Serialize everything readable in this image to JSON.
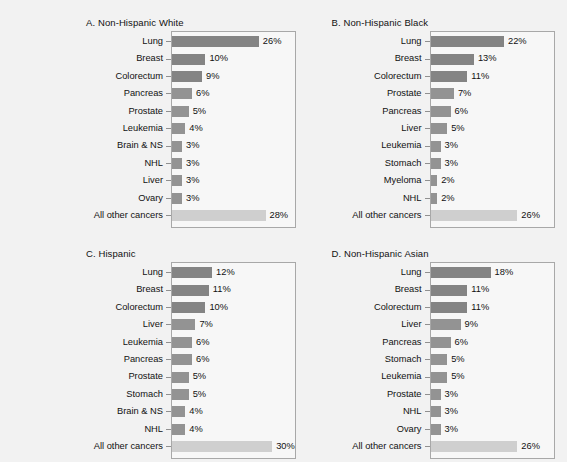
{
  "figure": {
    "background_color": "#f2f2f2",
    "bar_color": "#939393",
    "bar_color_top": "#848484",
    "bar_color_other": "#cfcfcf",
    "axis_color": "#a8a8a8"
  },
  "chart_data": [
    {
      "type": "bar",
      "title": "A. Non-Hispanic White",
      "orientation": "horizontal",
      "xlabel": "",
      "ylabel": "",
      "xlim": [
        0,
        32
      ],
      "grid": false,
      "legend": "none",
      "value_suffix": "%",
      "categories": [
        "Lung",
        "Breast",
        "Colorectum",
        "Pancreas",
        "Prostate",
        "Leukemia",
        "Brain & NS",
        "NHL",
        "Liver",
        "Ovary",
        "All other cancers"
      ],
      "values": [
        26,
        10,
        9,
        6,
        5,
        4,
        3,
        3,
        3,
        3,
        28
      ],
      "labels": [
        "26%",
        "10%",
        "9%",
        "6%",
        "5%",
        "4%",
        "3%",
        "3%",
        "3%",
        "3%",
        "28%"
      ]
    },
    {
      "type": "bar",
      "title": "B. Non-Hispanic Black",
      "orientation": "horizontal",
      "xlabel": "",
      "ylabel": "",
      "xlim": [
        0,
        32
      ],
      "grid": false,
      "legend": "none",
      "value_suffix": "%",
      "categories": [
        "Lung",
        "Breast",
        "Colorectum",
        "Prostate",
        "Pancreas",
        "Liver",
        "Leukemia",
        "Stomach",
        "Myeloma",
        "NHL",
        "All other cancers"
      ],
      "values": [
        22,
        13,
        11,
        7,
        6,
        5,
        3,
        3,
        2,
        2,
        26
      ],
      "labels": [
        "22%",
        "13%",
        "11%",
        "7%",
        "6%",
        "5%",
        "3%",
        "3%",
        "2%",
        "2%",
        "26%"
      ]
    },
    {
      "type": "bar",
      "title": "C. Hispanic",
      "orientation": "horizontal",
      "xlabel": "",
      "ylabel": "",
      "xlim": [
        0,
        32
      ],
      "grid": false,
      "legend": "none",
      "value_suffix": "%",
      "categories": [
        "Lung",
        "Breast",
        "Colorectum",
        "Liver",
        "Leukemia",
        "Pancreas",
        "Prostate",
        "Stomach",
        "Brain & NS",
        "NHL",
        "All other cancers"
      ],
      "values": [
        12,
        11,
        10,
        7,
        6,
        6,
        5,
        5,
        4,
        4,
        30
      ],
      "labels": [
        "12%",
        "11%",
        "10%",
        "7%",
        "6%",
        "6%",
        "5%",
        "5%",
        "4%",
        "4%",
        "30%"
      ]
    },
    {
      "type": "bar",
      "title": "D. Non-Hispanic Asian",
      "orientation": "horizontal",
      "xlabel": "",
      "ylabel": "",
      "xlim": [
        0,
        32
      ],
      "grid": false,
      "legend": "none",
      "value_suffix": "%",
      "categories": [
        "Lung",
        "Breast",
        "Colorectum",
        "Liver",
        "Pancreas",
        "Stomach",
        "Leukemia",
        "Prostate",
        "NHL",
        "Ovary",
        "All other cancers"
      ],
      "values": [
        18,
        11,
        11,
        9,
        6,
        5,
        5,
        3,
        3,
        3,
        26
      ],
      "labels": [
        "18%",
        "11%",
        "11%",
        "9%",
        "6%",
        "5%",
        "5%",
        "3%",
        "3%",
        "3%",
        "26%"
      ]
    }
  ]
}
